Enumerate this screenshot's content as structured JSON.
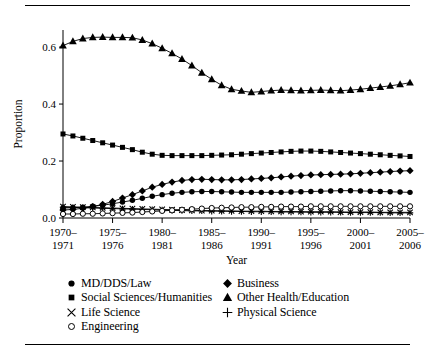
{
  "figure": {
    "has_top_rule": true,
    "has_bottom_rule": true,
    "ink_color": "#000000",
    "background_color": "#ffffff"
  },
  "chart_data": {
    "type": "line",
    "title": "",
    "xlabel": "Year",
    "ylabel": "Proportion",
    "grid": false,
    "legend_position": "below-plot",
    "xlim": [
      1970,
      2005
    ],
    "ylim": [
      0.0,
      0.66
    ],
    "ytick_labels": [
      "0.0",
      "0.2",
      "0.4",
      "0.6"
    ],
    "ytick_values": [
      0.0,
      0.2,
      0.4,
      0.6
    ],
    "xtick_labels": [
      "1970–\n1971",
      "1975–\n1976",
      "1980–\n1981",
      "1985–\n1986",
      "1990–\n1991",
      "1995–\n1996",
      "2000–\n2001",
      "2005–\n2006"
    ],
    "xtick_labels_line1": [
      "1970–",
      "1975–",
      "1980–",
      "1985–",
      "1990–",
      "1995–",
      "2000–",
      "2005–"
    ],
    "xtick_labels_line2": [
      "1971",
      "1976",
      "1981",
      "1986",
      "1991",
      "1996",
      "2001",
      "2006"
    ],
    "xtick_values": [
      1970,
      1975,
      1980,
      1985,
      1990,
      1995,
      2000,
      2005
    ],
    "x": [
      1970,
      1971,
      1972,
      1973,
      1974,
      1975,
      1976,
      1977,
      1978,
      1979,
      1980,
      1981,
      1982,
      1983,
      1984,
      1985,
      1986,
      1987,
      1988,
      1989,
      1990,
      1991,
      1992,
      1993,
      1994,
      1995,
      1996,
      1997,
      1998,
      1999,
      2000,
      2001,
      2002,
      2003,
      2004,
      2005
    ],
    "series": [
      {
        "name": "MD/DDS/Law",
        "marker": "filled-circle",
        "values": [
          0.035,
          0.036,
          0.038,
          0.041,
          0.045,
          0.05,
          0.056,
          0.062,
          0.069,
          0.076,
          0.082,
          0.087,
          0.09,
          0.092,
          0.093,
          0.093,
          0.092,
          0.091,
          0.09,
          0.09,
          0.09,
          0.09,
          0.09,
          0.091,
          0.092,
          0.093,
          0.094,
          0.095,
          0.096,
          0.096,
          0.095,
          0.094,
          0.093,
          0.092,
          0.091,
          0.09
        ]
      },
      {
        "name": "Business",
        "marker": "filled-diamond",
        "values": [
          0.028,
          0.03,
          0.034,
          0.04,
          0.048,
          0.058,
          0.07,
          0.082,
          0.095,
          0.108,
          0.118,
          0.126,
          0.132,
          0.135,
          0.136,
          0.135,
          0.134,
          0.134,
          0.135,
          0.137,
          0.139,
          0.141,
          0.144,
          0.147,
          0.149,
          0.151,
          0.152,
          0.153,
          0.154,
          0.155,
          0.157,
          0.159,
          0.161,
          0.163,
          0.165,
          0.166
        ]
      },
      {
        "name": "Social Sciences/Humanities",
        "marker": "filled-square",
        "values": [
          0.295,
          0.288,
          0.28,
          0.272,
          0.264,
          0.256,
          0.248,
          0.24,
          0.231,
          0.224,
          0.22,
          0.219,
          0.219,
          0.219,
          0.219,
          0.22,
          0.221,
          0.222,
          0.224,
          0.226,
          0.228,
          0.23,
          0.232,
          0.234,
          0.235,
          0.235,
          0.234,
          0.232,
          0.23,
          0.228,
          0.226,
          0.224,
          0.222,
          0.22,
          0.218,
          0.216
        ]
      },
      {
        "name": "Other Health/Education",
        "marker": "filled-triangle",
        "values": [
          0.605,
          0.62,
          0.63,
          0.634,
          0.635,
          0.634,
          0.634,
          0.633,
          0.625,
          0.612,
          0.596,
          0.578,
          0.558,
          0.535,
          0.51,
          0.487,
          0.466,
          0.452,
          0.446,
          0.441,
          0.444,
          0.447,
          0.449,
          0.448,
          0.447,
          0.448,
          0.449,
          0.448,
          0.447,
          0.449,
          0.452,
          0.456,
          0.46,
          0.464,
          0.469,
          0.475
        ]
      },
      {
        "name": "Life Science",
        "marker": "cross-x",
        "values": [
          0.04,
          0.039,
          0.038,
          0.037,
          0.036,
          0.035,
          0.034,
          0.033,
          0.032,
          0.031,
          0.03,
          0.029,
          0.028,
          0.027,
          0.026,
          0.026,
          0.025,
          0.025,
          0.024,
          0.024,
          0.024,
          0.023,
          0.023,
          0.023,
          0.022,
          0.022,
          0.022,
          0.022,
          0.021,
          0.021,
          0.021,
          0.021,
          0.02,
          0.02,
          0.02,
          0.02
        ]
      },
      {
        "name": "Physical Science",
        "marker": "plus",
        "values": [
          0.038,
          0.037,
          0.036,
          0.035,
          0.034,
          0.033,
          0.032,
          0.031,
          0.03,
          0.029,
          0.028,
          0.027,
          0.026,
          0.025,
          0.025,
          0.024,
          0.024,
          0.023,
          0.023,
          0.022,
          0.022,
          0.022,
          0.021,
          0.021,
          0.021,
          0.02,
          0.02,
          0.02,
          0.02,
          0.019,
          0.019,
          0.019,
          0.019,
          0.018,
          0.018,
          0.018
        ]
      },
      {
        "name": "Engineering",
        "marker": "open-circle",
        "values": [
          0.014,
          0.014,
          0.015,
          0.015,
          0.016,
          0.017,
          0.018,
          0.019,
          0.021,
          0.023,
          0.025,
          0.027,
          0.029,
          0.031,
          0.033,
          0.035,
          0.036,
          0.037,
          0.038,
          0.038,
          0.039,
          0.039,
          0.04,
          0.04,
          0.04,
          0.041,
          0.041,
          0.041,
          0.041,
          0.041,
          0.041,
          0.041,
          0.041,
          0.041,
          0.041,
          0.041
        ]
      }
    ]
  },
  "legend": {
    "column_1": [
      {
        "label": "MD/DDS/Law",
        "marker": "filled-circle"
      },
      {
        "label": "Social Sciences/Humanities",
        "marker": "filled-square"
      },
      {
        "label": "Life Science",
        "marker": "cross-x"
      },
      {
        "label": "Engineering",
        "marker": "open-circle"
      }
    ],
    "column_2": [
      {
        "label": "Business",
        "marker": "filled-diamond"
      },
      {
        "label": "Other Health/Education",
        "marker": "filled-triangle"
      },
      {
        "label": "Physical Science",
        "marker": "plus"
      }
    ]
  }
}
